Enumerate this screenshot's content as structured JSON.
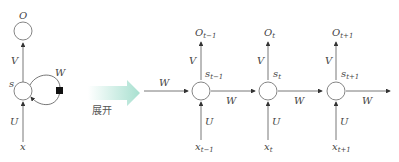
{
  "folded": {
    "output_label": "O",
    "hidden_label": "s",
    "input_label": "x",
    "weight_V": "V",
    "weight_U": "U",
    "weight_W": "W"
  },
  "transform": {
    "label": "展开",
    "arrow_color_start": "#ffffff",
    "arrow_color_end": "#a8e0d0"
  },
  "unfolded": {
    "incoming_W": "W",
    "steps": [
      {
        "output": "O",
        "output_sub": "t−1",
        "hidden": "s",
        "hidden_sub": "t−1",
        "input": "x",
        "input_sub": "t−1",
        "V": "V",
        "U": "U",
        "W": "W"
      },
      {
        "output": "O",
        "output_sub": "t",
        "hidden": "s",
        "hidden_sub": "t",
        "input": "x",
        "input_sub": "t",
        "V": "V",
        "U": "U",
        "W": "W"
      },
      {
        "output": "O",
        "output_sub": "t+1",
        "hidden": "s",
        "hidden_sub": "t+1",
        "input": "x",
        "input_sub": "t+1",
        "V": "V",
        "U": "U",
        "W": "W"
      }
    ]
  }
}
